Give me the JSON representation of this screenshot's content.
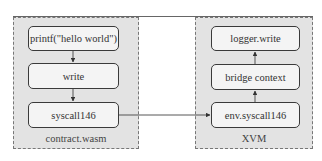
{
  "diagram": {
    "left_panel": {
      "label": "contract.wasm",
      "boxes": [
        "printf(\"hello world\")",
        "write",
        "syscall146"
      ]
    },
    "right_panel": {
      "label": "XVM",
      "boxes": [
        "logger.write",
        "bridge context",
        "env.syscall146"
      ]
    },
    "edges": [
      {
        "from": "printf(\"hello world\")",
        "to": "write"
      },
      {
        "from": "write",
        "to": "syscall146"
      },
      {
        "from": "syscall146",
        "to": "env.syscall146"
      },
      {
        "from": "env.syscall146",
        "to": "bridge context"
      },
      {
        "from": "bridge context",
        "to": "logger.write"
      }
    ]
  }
}
